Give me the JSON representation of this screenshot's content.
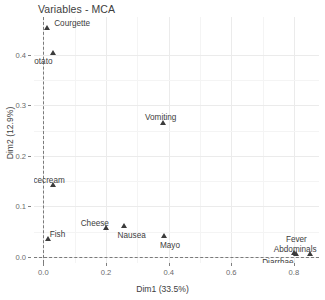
{
  "chart_data": {
    "type": "scatter",
    "title": "Variables - MCA",
    "xlabel": "Dim1 (33.5%)",
    "ylabel": "Dim2 (12.9%)",
    "xlim": [
      -0.03,
      0.88
    ],
    "ylim": [
      -0.012,
      0.475
    ],
    "xticks": [
      "0.0",
      "0.2",
      "0.4",
      "0.6",
      "0.8"
    ],
    "xtickvalues": [
      0.0,
      0.2,
      0.4,
      0.6,
      0.8
    ],
    "yticks": [
      "0.0",
      "0.1",
      "0.2",
      "0.3",
      "0.4"
    ],
    "ytickvalues": [
      0.0,
      0.1,
      0.2,
      0.3,
      0.4
    ],
    "grid": true,
    "legend": "none",
    "marker": "triangle",
    "marker_color": "#3b3b3b",
    "reference_lines": {
      "vertical_x": 0.0,
      "horizontal_y": 0.0,
      "style": "dashed",
      "color": "#7a7a7a"
    },
    "points": [
      {
        "label": "Courgette",
        "x": 0.012,
        "y": 0.452,
        "label_dx": 7,
        "label_dy": -9
      },
      {
        "label": "Potato",
        "x": 0.03,
        "y": 0.401,
        "label_dx": -24,
        "label_dy": 4
      },
      {
        "label": "Vomiting",
        "x": 0.382,
        "y": 0.264,
        "label_dx": -18,
        "label_dy": -10
      },
      {
        "label": "Icecream",
        "x": 0.031,
        "y": 0.141,
        "label_dx": -22,
        "label_dy": -9
      },
      {
        "label": "Cheese",
        "x": 0.199,
        "y": 0.055,
        "label_dx": -25,
        "label_dy": -9
      },
      {
        "label": "Nausea",
        "x": 0.256,
        "y": 0.059,
        "label_dx": -6,
        "label_dy": 5
      },
      {
        "label": "Mayo",
        "x": 0.385,
        "y": 0.04,
        "label_dx": -4,
        "label_dy": 5
      },
      {
        "label": "Fish",
        "x": 0.014,
        "y": 0.034,
        "label_dx": 2,
        "label_dy": -9
      },
      {
        "label": "Fever",
        "x": 0.8,
        "y": 0.006,
        "label_dx": -8,
        "label_dy": -18
      },
      {
        "label": "Abdominals",
        "x": 0.806,
        "y": 0.004,
        "label_dx": -22,
        "label_dy": -9
      },
      {
        "label": "Diarrhae",
        "x": 0.852,
        "y": 0.004,
        "label_dx": -48,
        "label_dy": 4
      }
    ]
  },
  "caption": ""
}
